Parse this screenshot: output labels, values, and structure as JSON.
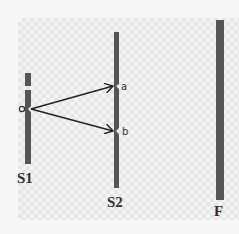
{
  "diagram": {
    "type": "double-slit experiment",
    "source_label": "o",
    "slit_labels": {
      "a": "a",
      "b": "b"
    },
    "barriers": [
      {
        "id": "S1",
        "label": "S1"
      },
      {
        "id": "S2",
        "label": "S2"
      },
      {
        "id": "F",
        "label": "F"
      }
    ],
    "colors": {
      "barrier": "#555555",
      "arrow": "#222222",
      "text": "#333333"
    }
  }
}
